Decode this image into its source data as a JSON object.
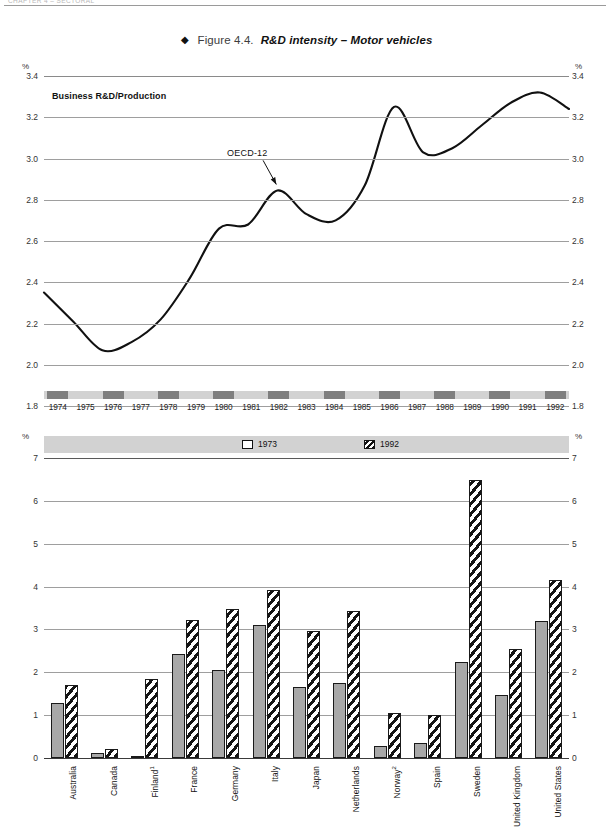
{
  "running_head": {
    "text": "CHAPTER 4 – SECTORAL"
  },
  "figure": {
    "diamond": "◆",
    "number": "Figure 4.4.",
    "caption": "R&D intensity – Motor vehicles"
  },
  "chart_data": [
    {
      "type": "line",
      "title": "Business R&D/Production",
      "panel_label": "Business R&D/Production",
      "xlabel": "",
      "ylabel": "%",
      "unit_label": "%",
      "ylim": [
        1.8,
        3.4
      ],
      "ytick_labels": [
        "3.4",
        "3.2",
        "3.0",
        "2.8",
        "2.6",
        "2.4",
        "2.2",
        "2.0",
        "1.8"
      ],
      "yticks": [
        3.4,
        3.2,
        3.0,
        2.8,
        2.6,
        2.4,
        2.2,
        2.0,
        1.8
      ],
      "grid": true,
      "legend": "none",
      "annotations": [
        {
          "text": "OECD-12",
          "x": 1981.1,
          "y": 3.02,
          "points_to_x": 1982.0,
          "points_to_y": 2.845
        }
      ],
      "x": [
        1974,
        1975,
        1976,
        1977,
        1978,
        1979,
        1980,
        1981,
        1982,
        1983,
        1984,
        1985,
        1986,
        1987,
        1988,
        1989,
        1990,
        1991,
        1992
      ],
      "categories": [
        "1974",
        "1975",
        "1976",
        "1977",
        "1978",
        "1979",
        "1980",
        "1981",
        "1982",
        "1983",
        "1984",
        "1985",
        "1986",
        "1987",
        "1988",
        "1989",
        "1990",
        "1991",
        "1992"
      ],
      "series": [
        {
          "name": "OECD-12",
          "values": [
            2.35,
            2.21,
            2.07,
            2.11,
            2.22,
            2.42,
            2.66,
            2.68,
            2.845,
            2.73,
            2.7,
            2.87,
            3.25,
            3.03,
            3.05,
            3.16,
            3.27,
            3.32,
            3.24
          ]
        }
      ]
    },
    {
      "type": "bar",
      "ylabel": "%",
      "unit_label": "%",
      "ylim": [
        0,
        7
      ],
      "yticks": [
        0,
        1,
        2,
        3,
        4,
        5,
        6,
        7
      ],
      "ytick_labels": [
        "0",
        "1",
        "2",
        "3",
        "4",
        "5",
        "6",
        "7"
      ],
      "grid": true,
      "legend_position": "top",
      "categories": [
        "Australia",
        "Canada",
        "Finland",
        "France",
        "Germany",
        "Italy",
        "Japan",
        "Netherlands",
        "Norway",
        "Spain",
        "Sweden",
        "United Kingdom",
        "United States"
      ],
      "category_footnotes": {
        "Finland": "1",
        "Norway": "2"
      },
      "series": [
        {
          "name": "1973",
          "values": [
            1.28,
            0.12,
            0.05,
            2.42,
            2.06,
            3.1,
            1.65,
            1.76,
            0.28,
            0.35,
            2.25,
            1.48,
            3.2
          ]
        },
        {
          "name": "1992",
          "values": [
            1.7,
            0.22,
            1.85,
            3.22,
            3.48,
            3.92,
            2.96,
            3.42,
            1.04,
            1.0,
            6.48,
            2.55,
            4.15
          ]
        }
      ]
    }
  ],
  "line_chart": {
    "unit_left": "%",
    "unit_right": "%",
    "panel_label": "Business R&D/Production",
    "annotation": "OECD-12"
  },
  "bar_chart": {
    "unit_left": "%",
    "unit_right": "%",
    "legend": [
      {
        "label": "1973",
        "pattern": "solid-gray"
      },
      {
        "label": "1992",
        "pattern": "diagonal-hatch"
      }
    ]
  }
}
